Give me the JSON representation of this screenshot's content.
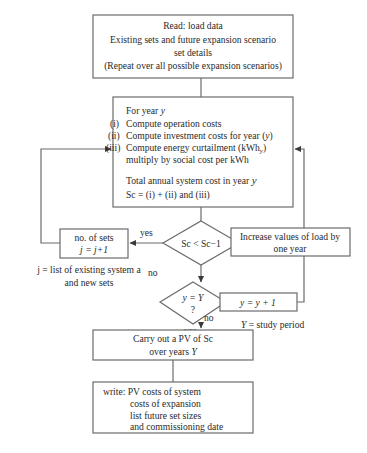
{
  "diagram": {
    "type": "flowchart",
    "nodes": {
      "read_box": {
        "lines": [
          "Read: load data",
          "Existing sets and future expansion scenario",
          "set details",
          "(Repeat over all possible expansion scenarios)"
        ]
      },
      "compute_box": {
        "header": "For year ",
        "header_var": "y",
        "items": [
          {
            "num": "(i)",
            "text": "Compute operation costs"
          },
          {
            "num": "(ii)",
            "text": "Compute investment costs for year (",
            "var": "y",
            "suffix": ")"
          },
          {
            "num": "(iii)",
            "text": "Compute energy curtailment (kWh",
            "sub": "y",
            "suffix": ")"
          },
          {
            "num": "",
            "text": "multiply by social cost per kWh"
          }
        ],
        "total_line": "Total annual system cost in year ",
        "total_var": "y",
        "formula": "Sc = (i) + (ii) and (iii)"
      },
      "decision_cost": {
        "text": "Sc < Sc−1"
      },
      "sets_box": {
        "line1": "no. of sets",
        "line2": "j = j+1"
      },
      "sets_note": {
        "line1": "j = list of existing system a",
        "line2": "and new sets"
      },
      "increase_box": {
        "line1": "Increase values of load by",
        "line2": "one year"
      },
      "decision_year": {
        "line1": "y = Y",
        "line2": "?"
      },
      "year_inc_box": {
        "text": "y = y + 1"
      },
      "study_note": {
        "var": "Y",
        "text": " = study period"
      },
      "pv_box": {
        "line1": "Carry out a PV of Sc",
        "line2": "over years ",
        "line2_var": "Y"
      },
      "write_box": {
        "lines": [
          "write: PV costs of system",
          "costs of expansion",
          "list future set sizes",
          "and commissioning date"
        ]
      }
    },
    "edge_labels": {
      "cost_yes": "yes",
      "cost_no": "no",
      "year_no": "no",
      "year_yes": "yes"
    },
    "colors": {
      "stroke": "#6b6b6b",
      "text": "#2a2a2a",
      "background": "#ffffff"
    }
  }
}
